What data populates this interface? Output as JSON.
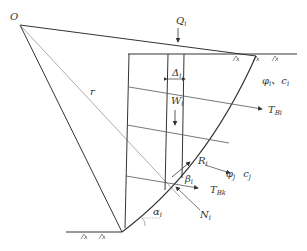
{
  "diagram": {
    "type": "slope stability slice analysis with anchor forces",
    "labels": {
      "center": "O",
      "radius": "r",
      "load": {
        "main": "Q",
        "sub": "i"
      },
      "slice_width": {
        "main": "Δ",
        "sub": "i"
      },
      "weight": {
        "main": "W",
        "sub": "i"
      },
      "upper_soil": {
        "phi": "φ",
        "phi_sub": "i",
        "sep": "、",
        "c": "c",
        "c_sub": "i"
      },
      "lower_soil": {
        "phi": "φ",
        "phi_sub": "j",
        "c": "c",
        "c_sub": "j"
      },
      "anchor_upper": {
        "main": "T",
        "sub": "Bi"
      },
      "anchor_lower": {
        "main": "T",
        "sub": "Bk"
      },
      "resistance": {
        "main": "R",
        "sub": "i"
      },
      "normal": {
        "main": "N",
        "sub": "i"
      },
      "beta": {
        "main": "β",
        "sub": "i"
      },
      "alpha": {
        "main": "α",
        "sub": "i"
      }
    },
    "colors": {
      "line": "#333333",
      "thin_line": "#777777"
    }
  }
}
